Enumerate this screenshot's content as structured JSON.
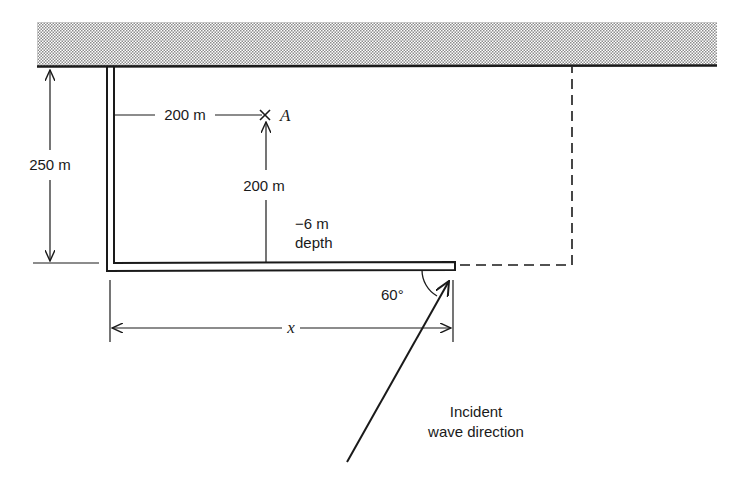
{
  "diagram": {
    "type": "harbor-breakwater-plan",
    "colors": {
      "ink": "#1a1a1a",
      "land_dots": "#9a9a9a",
      "background": "#ffffff"
    },
    "labels": {
      "dim_left": "250 m",
      "dim_horizontal_A": "200 m",
      "dim_vertical_A": "200 m",
      "point": "A",
      "depth_line1": "−6  m",
      "depth_line2": "depth",
      "angle": "60°",
      "dim_bottom": "x",
      "wave_line1": "Incident",
      "wave_line2": "wave direction"
    },
    "elements": [
      {
        "name": "shoreline-land",
        "desc": "shaded land strip along top"
      },
      {
        "name": "breakwater",
        "desc": "L-shaped breakwater extending from shore down then right"
      },
      {
        "name": "dashed-harbor-boundary",
        "desc": "dashed line completing rectangular harbor"
      },
      {
        "name": "point-A",
        "desc": "cross mark at point A"
      },
      {
        "name": "wave-arrow",
        "desc": "incident wave direction arrow at 60 degrees"
      }
    ]
  }
}
